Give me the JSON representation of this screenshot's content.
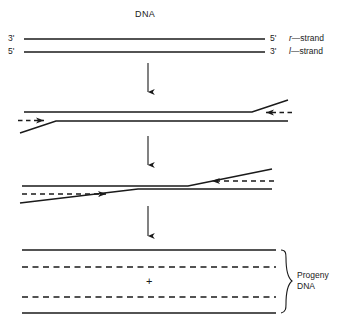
{
  "figure": {
    "title": "DNA",
    "background_color": "#ffffff",
    "line_color": "#1a1a1a",
    "width": 342,
    "height": 328
  },
  "top_panel": {
    "name": "parental-duplex",
    "title": "DNA",
    "left_labels": [
      "3'",
      "5'"
    ],
    "right_labels": [
      "5'",
      "3'"
    ],
    "strand_names": [
      "r—strand",
      "l—strand"
    ],
    "strand_name_r": "r—strand",
    "strand_name_l": "l—strand",
    "r_prefix": "r",
    "l_prefix": "l",
    "strand_suffix": "—strand"
  },
  "panel2": {
    "name": "strand-invasion-panel",
    "description": "crossed strands with nascent dashed strands at both ends"
  },
  "panel3": {
    "name": "branch-migration-panel",
    "description": "branch points migrated toward center with extended dashed strands"
  },
  "panel4": {
    "name": "progeny-panel",
    "plus_sign": "+",
    "bracket_label_line1": "Progeny",
    "bracket_label_line2": "DNA",
    "bracket_label": "Progeny DNA"
  },
  "arrows": {
    "step1": "↓",
    "step2": "↓",
    "step3": "↓",
    "count": 3
  }
}
